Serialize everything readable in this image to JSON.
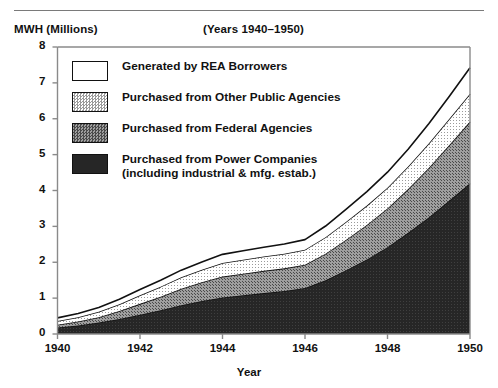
{
  "figure": {
    "y_axis_title": "MWH (Millions)",
    "subtitle": "(Years 1940–1950)",
    "x_axis_title": "Year"
  },
  "legend": {
    "items": [
      {
        "label": "Generated by REA Borrowers",
        "sub": "",
        "swatch": "white",
        "color": "#ffffff"
      },
      {
        "label": "Purchased from Other Public Agencies",
        "sub": "",
        "swatch": "light-gray-dotted",
        "color": "#d8d8d8"
      },
      {
        "label": "Purchased from Federal Agencies",
        "sub": "",
        "swatch": "mid-gray-dotted",
        "color": "#8c8c8c"
      },
      {
        "label": "Purchased from Power Companies",
        "sub": "(including industrial & mfg. estab.)",
        "swatch": "near-black",
        "color": "#232323"
      }
    ]
  },
  "chart_data": {
    "type": "area",
    "stacked": true,
    "title": "",
    "subtitle": "(Years 1940–1950)",
    "xlabel": "Year",
    "ylabel": "MWH (Millions)",
    "xlim": [
      1940,
      1950
    ],
    "ylim": [
      0,
      8
    ],
    "grid": false,
    "legend_position": "inside-upper-left",
    "x": [
      1940,
      1940.5,
      1941,
      1941.5,
      1942,
      1942.5,
      1943,
      1943.5,
      1944,
      1944.5,
      1945,
      1945.5,
      1946,
      1946.5,
      1947,
      1947.5,
      1948,
      1948.5,
      1949,
      1949.5,
      1950
    ],
    "xticks": [
      1940,
      1942,
      1944,
      1946,
      1948,
      1950
    ],
    "yticks": [
      0,
      1,
      2,
      3,
      4,
      5,
      6,
      7,
      8
    ],
    "series": [
      {
        "name": "Purchased from Power Companies (including industrial & mfg. estab.)",
        "color": "#232323",
        "values": [
          0.18,
          0.24,
          0.32,
          0.42,
          0.54,
          0.66,
          0.8,
          0.92,
          1.02,
          1.08,
          1.14,
          1.2,
          1.28,
          1.5,
          1.78,
          2.08,
          2.42,
          2.82,
          3.25,
          3.72,
          4.2
        ]
      },
      {
        "name": "Purchased from Federal Agencies",
        "color": "#8c8c8c",
        "values": [
          0.08,
          0.11,
          0.15,
          0.22,
          0.3,
          0.38,
          0.46,
          0.52,
          0.58,
          0.6,
          0.62,
          0.63,
          0.65,
          0.74,
          0.85,
          0.96,
          1.08,
          1.22,
          1.38,
          1.55,
          1.72
        ]
      },
      {
        "name": "Purchased from Other Public Agencies",
        "color": "#d8d8d8",
        "values": [
          0.1,
          0.12,
          0.15,
          0.19,
          0.24,
          0.28,
          0.32,
          0.35,
          0.38,
          0.39,
          0.4,
          0.41,
          0.42,
          0.46,
          0.5,
          0.54,
          0.58,
          0.63,
          0.68,
          0.73,
          0.78
        ]
      },
      {
        "name": "Generated by REA Borrowers",
        "color": "#ffffff",
        "values": [
          0.09,
          0.1,
          0.12,
          0.14,
          0.16,
          0.18,
          0.2,
          0.22,
          0.24,
          0.25,
          0.26,
          0.27,
          0.28,
          0.31,
          0.35,
          0.39,
          0.43,
          0.48,
          0.55,
          0.63,
          0.72
        ]
      }
    ],
    "totals": [
      0.45,
      0.57,
      0.74,
      0.97,
      1.24,
      1.5,
      1.78,
      2.01,
      2.22,
      2.32,
      2.42,
      2.51,
      2.63,
      3.01,
      3.48,
      3.97,
      4.51,
      5.15,
      5.86,
      6.63,
      7.42
    ]
  }
}
